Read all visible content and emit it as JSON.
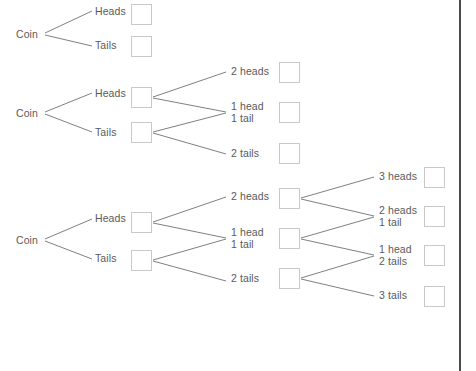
{
  "page": {
    "background_color": "#ffffff",
    "line_color": "#808080",
    "text_color": "#5a5a5a",
    "box_border_color": "#c9c9c9",
    "edge_color": "#4a4a4e"
  },
  "diagrams": [
    {
      "name": "one-flip-tree",
      "root_label": "Coin",
      "levels": [
        {
          "name": "flip-1",
          "nodes": [
            {
              "label": "Heads",
              "box": true,
              "box_value": ""
            },
            {
              "label": "Tails",
              "box": true,
              "box_value": ""
            }
          ]
        }
      ]
    },
    {
      "name": "two-flip-tree",
      "root_label": "Coin",
      "levels": [
        {
          "name": "flip-1",
          "nodes": [
            {
              "label": "Heads",
              "box": true,
              "box_value": ""
            },
            {
              "label": "Tails",
              "box": true,
              "box_value": ""
            }
          ]
        },
        {
          "name": "outcomes",
          "nodes": [
            {
              "label": "2 heads",
              "box": true,
              "box_value": ""
            },
            {
              "label": "1 head\n1 tail",
              "box": true,
              "box_value": ""
            },
            {
              "label": "2 tails",
              "box": true,
              "box_value": ""
            }
          ]
        }
      ]
    },
    {
      "name": "three-flip-tree",
      "root_label": "Coin",
      "levels": [
        {
          "name": "flip-1",
          "nodes": [
            {
              "label": "Heads",
              "box": true,
              "box_value": ""
            },
            {
              "label": "Tails",
              "box": true,
              "box_value": ""
            }
          ]
        },
        {
          "name": "flip-2-outcomes",
          "nodes": [
            {
              "label": "2 heads",
              "box": true,
              "box_value": ""
            },
            {
              "label": "1 head\n1 tail",
              "box": true,
              "box_value": ""
            },
            {
              "label": "2 tails",
              "box": true,
              "box_value": ""
            }
          ]
        },
        {
          "name": "flip-3-outcomes",
          "nodes": [
            {
              "label": "3 heads",
              "box": true,
              "box_value": ""
            },
            {
              "label": "2 heads\n1 tail",
              "box": true,
              "box_value": ""
            },
            {
              "label": "1 head\n2 tails",
              "box": true,
              "box_value": ""
            },
            {
              "label": "3 tails",
              "box": true,
              "box_value": ""
            }
          ]
        }
      ]
    }
  ],
  "labels": {
    "d1_root": "Coin",
    "d1_heads": "Heads",
    "d1_tails": "Tails",
    "d2_root": "Coin",
    "d2_heads": "Heads",
    "d2_tails": "Tails",
    "d2_o1": "2 heads",
    "d2_o2": "1 head\n1 tail",
    "d2_o3": "2 tails",
    "d3_root": "Coin",
    "d3_heads": "Heads",
    "d3_tails": "Tails",
    "d3_m1": "2 heads",
    "d3_m2": "1 head\n1 tail",
    "d3_m3": "2 tails",
    "d3_r1": "3 heads",
    "d3_r2": "2 heads\n1 tail",
    "d3_r3": "1 head\n2 tails",
    "d3_r4": "3 tails"
  }
}
